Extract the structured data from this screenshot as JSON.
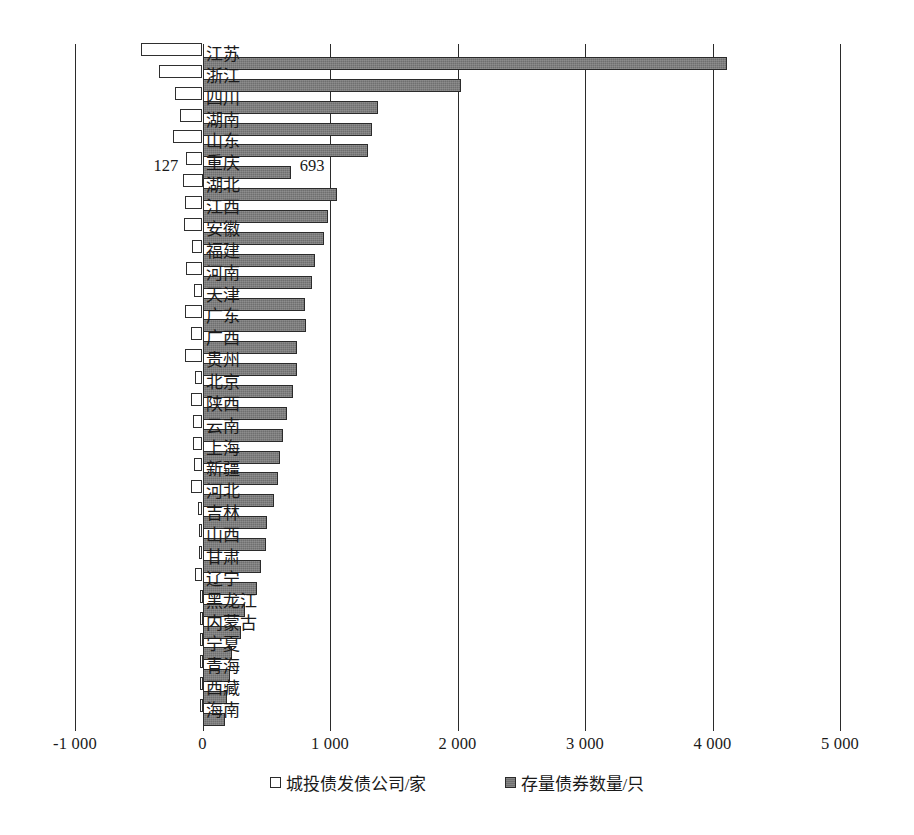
{
  "chart_data": {
    "type": "bar",
    "orientation": "horizontal",
    "title": "",
    "subtitle": "",
    "xlabel": "",
    "ylabel": "",
    "xlim": [
      -1000,
      5000
    ],
    "xticks": [
      -1000,
      0,
      1000,
      2000,
      3000,
      4000,
      5000
    ],
    "xtick_labels": [
      "-1 000",
      "0",
      "1 000",
      "2 000",
      "3 000",
      "4 000",
      "5 000"
    ],
    "grid": true,
    "legend_position": "bottom",
    "legend": [
      "城投债发债公司/家",
      "存量债券数量/只"
    ],
    "categories": [
      "江苏",
      "浙江",
      "四川",
      "湖南",
      "山东",
      "重庆",
      "湖北",
      "江西",
      "安徽",
      "福建",
      "河南",
      "天津",
      "广东",
      "广西",
      "贵州",
      "北京",
      "陕西",
      "云南",
      "上海",
      "新疆",
      "河北",
      "吉林",
      "山西",
      "甘肃",
      "辽宁",
      "黑龙江",
      "内蒙古",
      "宁夏",
      "青海",
      "西藏",
      "海南"
    ],
    "series": [
      {
        "name": "城投债发债公司/家",
        "unit": "家",
        "style": "open",
        "direction": "left",
        "values": [
          483,
          340,
          215,
          178,
          232,
          127,
          150,
          140,
          148,
          80,
          132,
          70,
          138,
          92,
          137,
          62,
          94,
          72,
          72,
          63,
          88,
          38,
          30,
          28,
          55,
          18,
          20,
          12,
          10,
          8,
          10
        ]
      },
      {
        "name": "存量债券数量/只",
        "unit": "只",
        "style": "filled",
        "direction": "right",
        "values": [
          4115,
          2030,
          1380,
          1330,
          1300,
          693,
          1055,
          985,
          950,
          880,
          860,
          800,
          810,
          740,
          745,
          710,
          665,
          630,
          610,
          590,
          560,
          505,
          495,
          460,
          430,
          330,
          300,
          230,
          215,
          195,
          175
        ]
      }
    ],
    "data_labels": [
      {
        "category": "重庆",
        "series": "城投债发债公司/家",
        "value": "127"
      },
      {
        "category": "重庆",
        "series": "存量债券数量/只",
        "value": "693"
      }
    ]
  }
}
